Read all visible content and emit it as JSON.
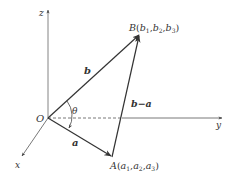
{
  "diagram": {
    "axes": {
      "x": {
        "label": "x"
      },
      "y": {
        "label": "y"
      },
      "z": {
        "label": "z"
      }
    },
    "origin": {
      "label": "O"
    },
    "points": {
      "A": {
        "name": "A",
        "open": "(",
        "c1": "a",
        "s1": "1",
        "c2": "a",
        "s2": "2",
        "c3": "a",
        "s3": "3",
        "close": ")",
        "sep": ","
      },
      "B": {
        "name": "B",
        "open": "(",
        "c1": "b",
        "s1": "1",
        "c2": "b",
        "s2": "2",
        "c3": "b",
        "s3": "3",
        "close": ")",
        "sep": ","
      }
    },
    "vectors": {
      "a": {
        "label": "a"
      },
      "b": {
        "label": "b"
      },
      "b_minus_a": {
        "label": "b−a"
      }
    },
    "angle": {
      "label": "θ"
    },
    "colors": {
      "line": "#333333",
      "axis": "#555555",
      "background": "#ffffff"
    }
  }
}
